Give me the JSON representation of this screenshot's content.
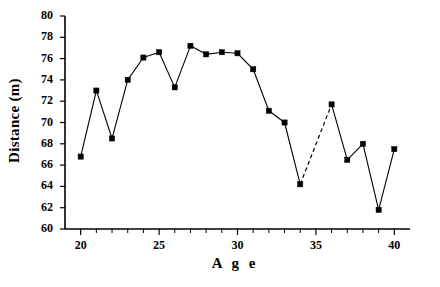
{
  "chart_data": {
    "type": "line",
    "title": "",
    "xlabel": "A g e",
    "ylabel": "Distance (m)",
    "xlim": [
      19,
      41
    ],
    "ylim": [
      60,
      80
    ],
    "xticks": [
      20,
      25,
      30,
      35,
      40
    ],
    "yticks": [
      60,
      62,
      64,
      66,
      68,
      70,
      72,
      74,
      76,
      78,
      80
    ],
    "x_minor_tick_step": 1,
    "grid": false,
    "legend": null,
    "marker": "filled-square",
    "line_color": "#000000",
    "x": [
      20,
      21,
      22,
      23,
      24,
      25,
      26,
      27,
      28,
      29,
      30,
      31,
      32,
      33,
      34,
      36,
      37,
      38,
      39,
      40
    ],
    "values": [
      66.8,
      73.0,
      68.5,
      74.0,
      76.1,
      76.6,
      73.3,
      77.2,
      76.4,
      76.6,
      76.5,
      75.0,
      71.1,
      70.0,
      64.2,
      71.7,
      66.5,
      68.0,
      61.8,
      67.5
    ],
    "missing_x": [
      35
    ],
    "dashed_segment": {
      "from_x": 34,
      "to_x": 36,
      "note": "interpolated across missing age 35"
    },
    "annotations": []
  },
  "axis": {
    "ylabel_text": "Distance (m)",
    "xlabel_text": "A g e",
    "ytick_labels": [
      "80",
      "78",
      "76",
      "74",
      "72",
      "70",
      "68",
      "66",
      "64",
      "62",
      "60"
    ],
    "xtick_labels": [
      "20",
      "25",
      "30",
      "35",
      "40"
    ]
  }
}
